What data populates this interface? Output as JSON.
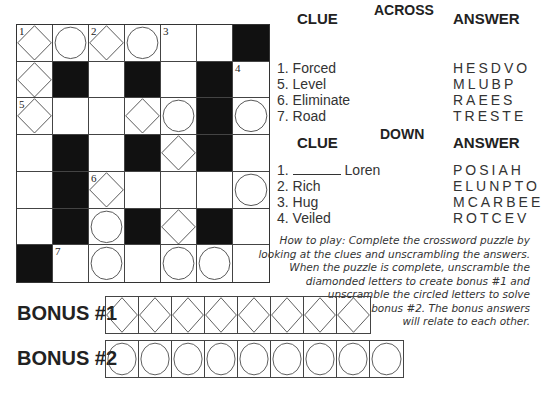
{
  "grid": {
    "rows": [
      [
        {
          "t": "D",
          "n": "1"
        },
        {
          "t": "C"
        },
        {
          "t": "D",
          "n": "2"
        },
        {
          "t": "C"
        },
        {
          "t": "W",
          "n": "3"
        },
        {
          "t": "W"
        },
        {
          "t": "B"
        }
      ],
      [
        {
          "t": "D"
        },
        {
          "t": "B"
        },
        {
          "t": "W"
        },
        {
          "t": "B"
        },
        {
          "t": "W"
        },
        {
          "t": "B"
        },
        {
          "t": "W",
          "n": "4"
        }
      ],
      [
        {
          "t": "D",
          "n": "5"
        },
        {
          "t": "W"
        },
        {
          "t": "W"
        },
        {
          "t": "D"
        },
        {
          "t": "C"
        },
        {
          "t": "B"
        },
        {
          "t": "C"
        }
      ],
      [
        {
          "t": "W"
        },
        {
          "t": "B"
        },
        {
          "t": "W"
        },
        {
          "t": "B"
        },
        {
          "t": "D"
        },
        {
          "t": "B"
        },
        {
          "t": "W"
        }
      ],
      [
        {
          "t": "W"
        },
        {
          "t": "B"
        },
        {
          "t": "D",
          "n": "6"
        },
        {
          "t": "W"
        },
        {
          "t": "W"
        },
        {
          "t": "W"
        },
        {
          "t": "C"
        }
      ],
      [
        {
          "t": "W"
        },
        {
          "t": "B"
        },
        {
          "t": "C"
        },
        {
          "t": "B"
        },
        {
          "t": "D"
        },
        {
          "t": "B"
        },
        {
          "t": "W"
        }
      ],
      [
        {
          "t": "B"
        },
        {
          "t": "W",
          "n": "7"
        },
        {
          "t": "C"
        },
        {
          "t": "W"
        },
        {
          "t": "C"
        },
        {
          "t": "C"
        },
        {
          "t": "W"
        }
      ]
    ]
  },
  "across": {
    "title": "ACROSS",
    "clue_header": "CLUE",
    "answer_header": "ANSWER",
    "items": [
      {
        "num": "1.",
        "clue": "Forced",
        "answer": "HESDVO"
      },
      {
        "num": "5.",
        "clue": "Level",
        "answer": "MLUBP"
      },
      {
        "num": "6.",
        "clue": "Eliminate",
        "answer": "RAEES"
      },
      {
        "num": "7.",
        "clue": "Road",
        "answer": "TRESTE"
      }
    ]
  },
  "down": {
    "title": "DOWN",
    "clue_header": "CLUE",
    "answer_header": "ANSWER",
    "items": [
      {
        "num": "1.",
        "clue": "Loren",
        "blank": true,
        "answer": "POSIAH"
      },
      {
        "num": "2.",
        "clue": "Rich",
        "answer": "ELUNPTO"
      },
      {
        "num": "3.",
        "clue": "Hug",
        "answer": "MCARBEE"
      },
      {
        "num": "4.",
        "clue": "Veiled",
        "answer": "ROTCEV"
      }
    ]
  },
  "instructions": {
    "lines": [
      "How to play: Complete the crossword puzzle by",
      "looking at the clues and unscrambling the answers.",
      "When the puzzle is complete, unscramble the",
      "diamonded letters to create bonus #1 and",
      "unscramble the circled letters to solve",
      "bonus #2. The bonus answers",
      "will relate to each other."
    ]
  },
  "bonus": [
    {
      "label": "BONUS #1",
      "shape": "D",
      "count": 8
    },
    {
      "label": "BONUS #2",
      "shape": "C",
      "count": 9
    }
  ]
}
